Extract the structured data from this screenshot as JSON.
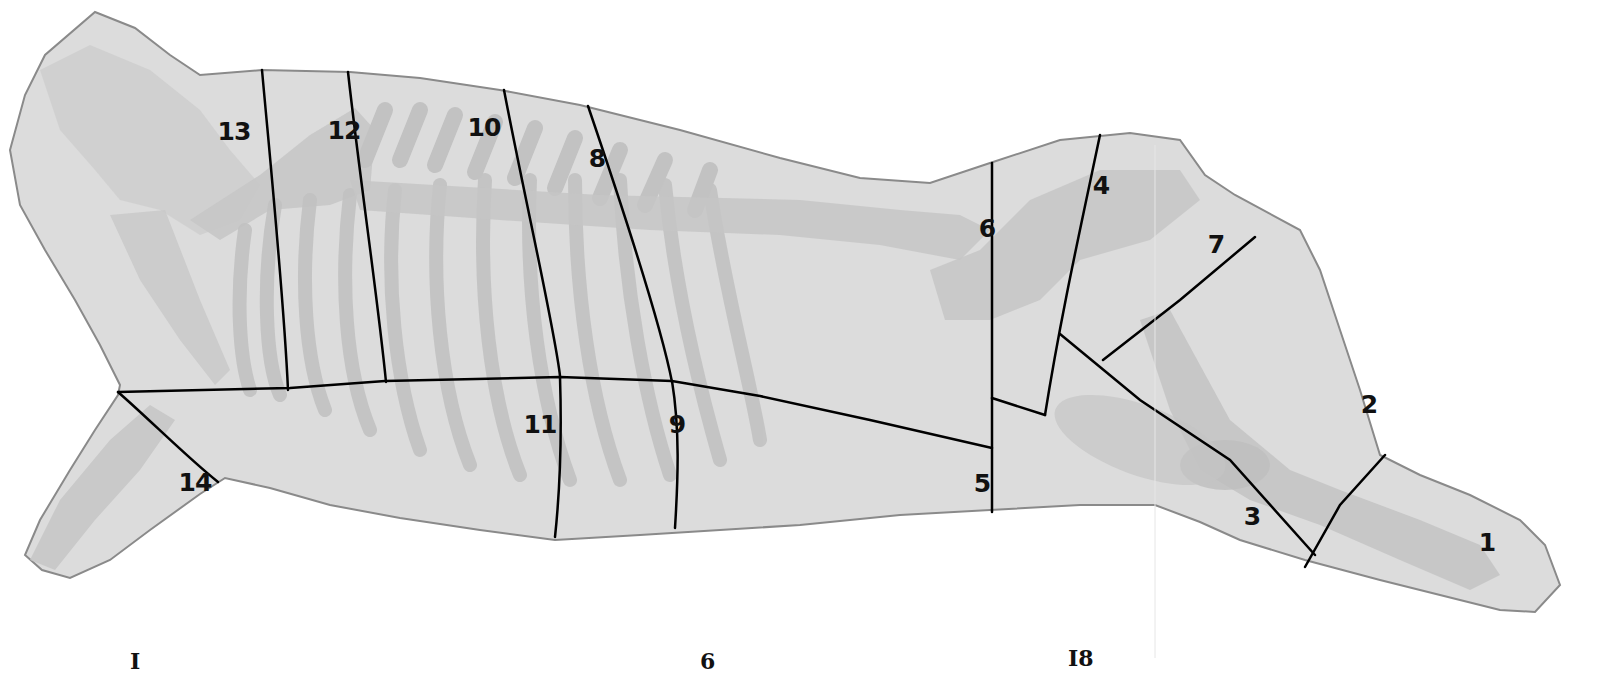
{
  "diagram": {
    "colors": {
      "background": "#ffffff",
      "carcass_fill": "#dcdcdc",
      "carcass_outline": "#8a8a8a",
      "bone_fill": "#c4c4c4",
      "cut_line": "#000000",
      "label": "#111111"
    },
    "cut_labels": [
      {
        "id": "1",
        "label": "1",
        "x": 1487,
        "y": 542
      },
      {
        "id": "2",
        "label": "2",
        "x": 1369,
        "y": 404
      },
      {
        "id": "3",
        "label": "3",
        "x": 1252,
        "y": 516
      },
      {
        "id": "4",
        "label": "4",
        "x": 1101,
        "y": 185
      },
      {
        "id": "5",
        "label": "5",
        "x": 982,
        "y": 483
      },
      {
        "id": "6",
        "label": "6",
        "x": 987,
        "y": 228
      },
      {
        "id": "7",
        "label": "7",
        "x": 1216,
        "y": 244
      },
      {
        "id": "8",
        "label": "8",
        "x": 597,
        "y": 158
      },
      {
        "id": "9",
        "label": "9",
        "x": 677,
        "y": 424
      },
      {
        "id": "10",
        "label": "10",
        "x": 484,
        "y": 127
      },
      {
        "id": "11",
        "label": "11",
        "x": 540,
        "y": 424
      },
      {
        "id": "12",
        "label": "12",
        "x": 344,
        "y": 130
      },
      {
        "id": "13",
        "label": "13",
        "x": 234,
        "y": 131
      },
      {
        "id": "14",
        "label": "14",
        "x": 195,
        "y": 482
      }
    ],
    "bottom_fragments": [
      {
        "label": "I",
        "x": 130,
        "y": 650
      },
      {
        "label": "6",
        "x": 700,
        "y": 650
      },
      {
        "label": "I8",
        "x": 1068,
        "y": 647
      }
    ]
  }
}
